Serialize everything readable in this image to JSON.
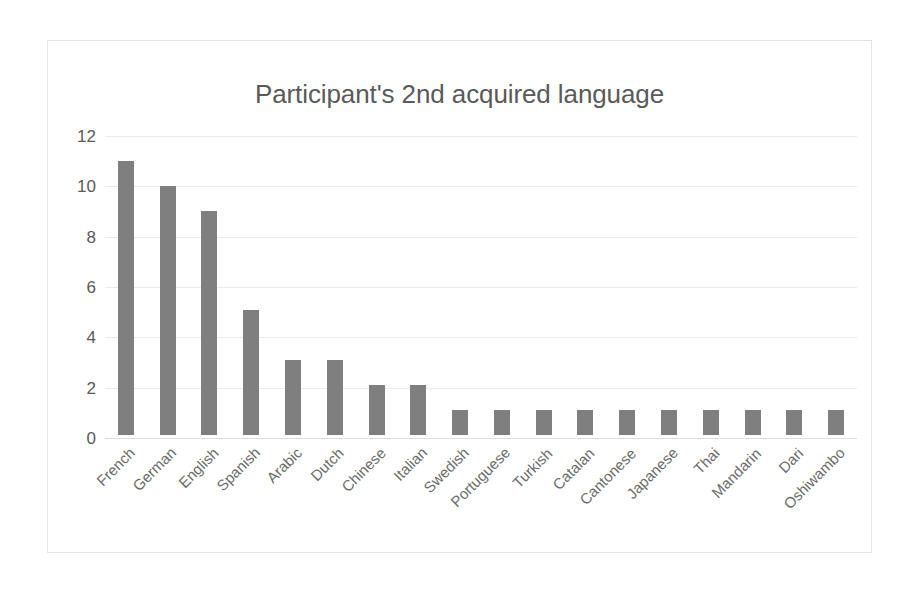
{
  "chart_data": {
    "type": "bar",
    "title": "Participant's 2nd acquired language",
    "xlabel": "",
    "ylabel": "",
    "ylim": [
      0,
      12
    ],
    "yticks": [
      0,
      2,
      4,
      6,
      8,
      10,
      12
    ],
    "grid": true,
    "legend": false,
    "bar_color": "#7f7f7f",
    "categories": [
      "French",
      "German",
      "English",
      "Spanish",
      "Arabic",
      "Dutch",
      "Chinese",
      "Italian",
      "Swedish",
      "Portuguese",
      "Turkish",
      "Catalan",
      "Cantonese",
      "Japanese",
      "Thai",
      "Mandarin",
      "Dari",
      "Oshiwambo"
    ],
    "values": [
      11,
      10,
      9,
      5,
      3,
      3,
      2,
      2,
      1,
      1,
      1,
      1,
      1,
      1,
      1,
      1,
      1,
      1
    ]
  },
  "style": {
    "title_color": "#5a5a5a",
    "tick_color": "#5a5a5a",
    "gridline_color": "#eaeaea",
    "frame_border_color": "#e3e3e3",
    "background": "#ffffff"
  }
}
